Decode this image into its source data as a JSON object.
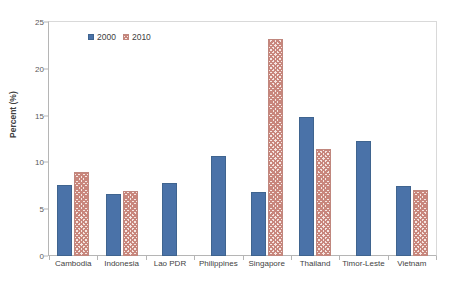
{
  "chart_data": {
    "type": "bar",
    "title": "",
    "xlabel": "",
    "ylabel": "Percent (%)",
    "ylim": [
      0,
      25
    ],
    "yticks": [
      0,
      5,
      10,
      15,
      20,
      25
    ],
    "ytick_labels": [
      "0",
      "5",
      "10",
      "15",
      "20",
      "25"
    ],
    "grid": false,
    "legend_position": "top-left-inside",
    "categories": [
      "Cambodia",
      "Indonesia",
      "Lao PDR",
      "Philippines",
      "Singapore",
      "Thailand",
      "Timor-Leste",
      "Vietnam"
    ],
    "series": [
      {
        "name": "2000",
        "color": "#4a72a8",
        "values": [
          7.6,
          6.6,
          7.8,
          10.7,
          6.8,
          14.8,
          12.3,
          7.5
        ]
      },
      {
        "name": "2010",
        "color": "#c8867c",
        "values": [
          9.0,
          6.9,
          null,
          null,
          23.2,
          11.4,
          null,
          7.1
        ]
      }
    ]
  },
  "legend": {
    "items": [
      {
        "label": "2000",
        "swatch": "series-2000-swatch"
      },
      {
        "label": "2010",
        "swatch": "series-2010-swatch"
      }
    ]
  },
  "axis": {
    "y_title": "Percent (%)"
  }
}
